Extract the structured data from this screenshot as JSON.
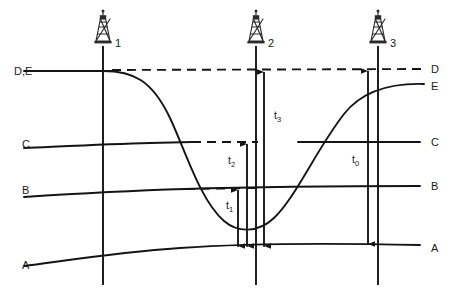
{
  "figure": {
    "type": "diagram"
  },
  "horizons": {
    "left_labels": [
      {
        "id": "DE",
        "text": "D,E",
        "y": 71
      },
      {
        "id": "C",
        "text": "C",
        "y": 144
      },
      {
        "id": "B",
        "text": "B",
        "y": 190
      },
      {
        "id": "A",
        "text": "A",
        "y": 264
      }
    ],
    "right_labels": [
      {
        "id": "D",
        "text": "D",
        "y": 70
      },
      {
        "id": "E",
        "text": "E",
        "y": 86
      },
      {
        "id": "C",
        "text": "C",
        "y": 142
      },
      {
        "id": "B",
        "text": "B",
        "y": 186
      },
      {
        "id": "A",
        "text": "A",
        "y": 249
      }
    ]
  },
  "wells": [
    {
      "id": "well-1",
      "label": "1",
      "x": 103,
      "label_x": 115,
      "label_y": 43
    },
    {
      "id": "well-2",
      "label": "2",
      "x": 256,
      "label_x": 268,
      "label_y": 43
    },
    {
      "id": "well-3",
      "label": "3",
      "x": 378,
      "label_x": 390,
      "label_y": 43
    }
  ],
  "time_intervals": [
    {
      "id": "t0",
      "base": "t",
      "sub": "0",
      "x": 356,
      "y": 160,
      "well": "3",
      "from": "D",
      "to": "A"
    },
    {
      "id": "t1",
      "base": "t",
      "sub": "1",
      "x": 226,
      "y": 206,
      "well": "2",
      "from": "B",
      "to": "A"
    },
    {
      "id": "t2",
      "base": "t",
      "sub": "2",
      "x": 228,
      "y": 161,
      "well": "2",
      "from": "C",
      "to": "A"
    },
    {
      "id": "t3",
      "base": "t",
      "sub": "3",
      "x": 274,
      "y": 116,
      "well": "2",
      "from": "D",
      "to": "A"
    }
  ],
  "colors": {
    "line": "#141414",
    "text": "#1a1a1a",
    "derrick": "#2b2b2b",
    "background": "#ffffff"
  },
  "geometry": {
    "width": 450,
    "height": 300,
    "horizon_A_path": "M 24 266 C 70 260 120 252 180 248 C 250 243 330 243 420 245",
    "horizon_B_path": "M 24 197 C 70 194 120 191 185 189 C 250 187 330 186 420 186",
    "horizon_B_dash_path": "M 185 189 L 258 188",
    "horizon_C_path": "M 24 148 C 70 146 110 144 160 143 C 180 142 185 142 190 142",
    "horizon_C_right_path": "M 300 142 C 340 142 380 142 420 142",
    "horizon_C_dash_path": "M 190 142 L 258 142",
    "horizon_DE_left_path": "M 24 71 L 110 71",
    "horizon_D_dash_path": "M 110 70 L 424 69",
    "horizon_E_curve_path": "M 103 71 C 140 71 160 85 180 130 C 200 175 210 212 238 226 C 260 236 280 228 300 200 C 330 158 350 110 380 92 C 398 83 412 83 424 84"
  }
}
